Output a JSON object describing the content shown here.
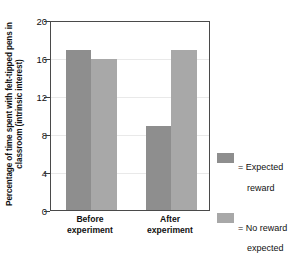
{
  "chart_data": {
    "type": "bar",
    "title": "",
    "subtitle": "",
    "xlabel": "",
    "ylabel": "Percentage of time spent with felt-tipped pens in classroom (intrinsic interest)",
    "categories": [
      "Before experiment",
      "After experiment"
    ],
    "category_lines": [
      [
        "Before",
        "experiment"
      ],
      [
        "After",
        "experiment"
      ]
    ],
    "series": [
      {
        "name": "= Expected reward",
        "label_lines": [
          "= Expected",
          "reward"
        ],
        "color": "#8e8e8e",
        "values": [
          16.8,
          8.8
        ]
      },
      {
        "name": "= No reward expected",
        "label_lines": [
          "= No reward",
          "expected"
        ],
        "color": "#a8a8a8",
        "values": [
          15.9,
          16.8
        ]
      }
    ],
    "ylim": [
      0,
      20
    ],
    "yticks": [
      0,
      4,
      8,
      12,
      16,
      20
    ],
    "ytick_labels": [
      "0",
      "4",
      "8",
      "12",
      "16",
      "20"
    ],
    "grid": true,
    "legend_position": "right",
    "frame": true
  },
  "axis": {
    "y_title": "Percentage of time spent with felt-tipped pens in classroom (intrinsic interest)",
    "tick_0": "0",
    "tick_4": "4",
    "tick_8": "8",
    "tick_12": "12",
    "tick_16": "16",
    "tick_20": "20"
  },
  "categories": {
    "before_line1": "Before",
    "before_line2": "experiment",
    "after_line1": "After",
    "after_line2": "experiment"
  },
  "legend": {
    "items": [
      {
        "line1": "= Expected",
        "line2": "reward",
        "color": "#8e8e8e"
      },
      {
        "line1": "= No reward",
        "line2": "expected",
        "color": "#a8a8a8"
      }
    ]
  },
  "colors": {
    "expected_reward": "#8e8e8e",
    "no_reward_expected": "#a8a8a8",
    "frame": "#4a4a4a",
    "grid": "#e9e9e9",
    "background": "#ffffff",
    "text": "#111111"
  }
}
